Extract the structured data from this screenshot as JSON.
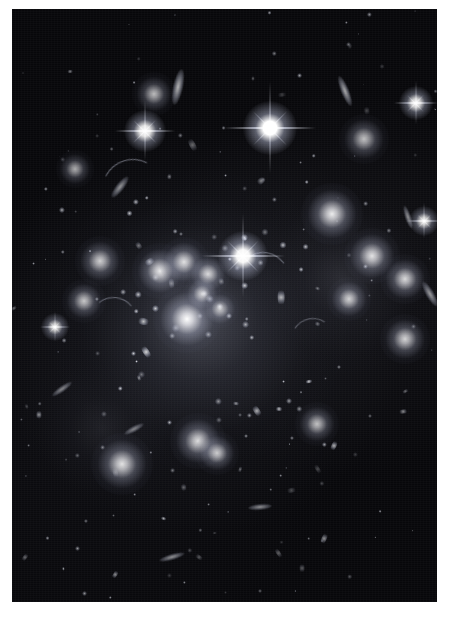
{
  "image": {
    "title": "Galaxy Cluster Deep Field",
    "subject": "galaxy-cluster",
    "observation_band": "optical",
    "border_color": "#ffffff",
    "sky_color": "#07070a",
    "object_color": "#ffffff",
    "plate": {
      "x": 12,
      "y": 9,
      "width": 425,
      "height": 593
    },
    "canvas": {
      "width": 451,
      "height": 621
    }
  },
  "chart_data": {
    "type": "scatter",
    "xlabel": "",
    "ylabel": "",
    "xlim": [
      0,
      425
    ],
    "ylim": [
      0,
      593
    ],
    "grid": false,
    "legend": null,
    "series": [
      {
        "name": "diffuse-intracluster-light",
        "values": [
          {
            "x": 186,
            "y": 310,
            "r": 150,
            "b": 0.2
          },
          {
            "x": 330,
            "y": 270,
            "r": 95,
            "b": 0.12
          },
          {
            "x": 90,
            "y": 420,
            "r": 80,
            "b": 0.08
          }
        ]
      },
      {
        "name": "bright-stars-with-diffraction-spikes",
        "values": [
          {
            "x": 258,
            "y": 119,
            "r": 6.5,
            "b": 1.0,
            "spike": 46
          },
          {
            "x": 231,
            "y": 247,
            "r": 6.0,
            "b": 0.96,
            "spike": 42
          },
          {
            "x": 133,
            "y": 122,
            "r": 5.0,
            "b": 0.88,
            "spike": 30
          },
          {
            "x": 404,
            "y": 94,
            "r": 4.0,
            "b": 0.8,
            "spike": 22
          },
          {
            "x": 412,
            "y": 212,
            "r": 3.6,
            "b": 0.74,
            "spike": 18
          },
          {
            "x": 43,
            "y": 318,
            "r": 3.4,
            "b": 0.7,
            "spike": 15
          }
        ]
      },
      {
        "name": "bright-elliptical-galaxies",
        "values": [
          {
            "x": 175,
            "y": 310,
            "r": 11,
            "b": 1.0
          },
          {
            "x": 148,
            "y": 262,
            "r": 9,
            "b": 0.9
          },
          {
            "x": 172,
            "y": 253,
            "r": 8,
            "b": 0.86
          },
          {
            "x": 196,
            "y": 265,
            "r": 7,
            "b": 0.82
          },
          {
            "x": 190,
            "y": 285,
            "r": 6,
            "b": 0.78
          },
          {
            "x": 320,
            "y": 205,
            "r": 10,
            "b": 0.92
          },
          {
            "x": 360,
            "y": 247,
            "r": 9,
            "b": 0.88
          },
          {
            "x": 393,
            "y": 270,
            "r": 8,
            "b": 0.84
          },
          {
            "x": 337,
            "y": 290,
            "r": 7,
            "b": 0.8
          },
          {
            "x": 393,
            "y": 330,
            "r": 8,
            "b": 0.82
          },
          {
            "x": 88,
            "y": 252,
            "r": 8,
            "b": 0.8
          },
          {
            "x": 72,
            "y": 292,
            "r": 7,
            "b": 0.76
          },
          {
            "x": 110,
            "y": 455,
            "r": 10,
            "b": 0.88
          },
          {
            "x": 186,
            "y": 432,
            "r": 9,
            "b": 0.86
          },
          {
            "x": 205,
            "y": 444,
            "r": 7,
            "b": 0.78
          },
          {
            "x": 208,
            "y": 300,
            "r": 6,
            "b": 0.72
          },
          {
            "x": 305,
            "y": 415,
            "r": 7,
            "b": 0.74
          },
          {
            "x": 142,
            "y": 85,
            "r": 7,
            "b": 0.72
          },
          {
            "x": 352,
            "y": 130,
            "r": 8,
            "b": 0.74
          },
          {
            "x": 63,
            "y": 160,
            "r": 6,
            "b": 0.66
          }
        ]
      },
      {
        "name": "edge-on-spiral-galaxies",
        "values": [
          {
            "x": 166,
            "y": 78,
            "rx": 5,
            "ry": 18,
            "angle": 12,
            "b": 0.7
          },
          {
            "x": 333,
            "y": 82,
            "rx": 4,
            "ry": 16,
            "angle": -22,
            "b": 0.66
          },
          {
            "x": 108,
            "y": 178,
            "rx": 4,
            "ry": 13,
            "angle": 38,
            "b": 0.58
          },
          {
            "x": 396,
            "y": 208,
            "rx": 3,
            "ry": 12,
            "angle": -18,
            "b": 0.56
          },
          {
            "x": 50,
            "y": 380,
            "rx": 3,
            "ry": 12,
            "angle": 55,
            "b": 0.52
          },
          {
            "x": 160,
            "y": 548,
            "rx": 3,
            "ry": 13,
            "angle": 74,
            "b": 0.56
          },
          {
            "x": 248,
            "y": 498,
            "rx": 3,
            "ry": 12,
            "angle": 85,
            "b": 0.54
          },
          {
            "x": 418,
            "y": 285,
            "rx": 4,
            "ry": 14,
            "angle": -30,
            "b": 0.6
          },
          {
            "x": 122,
            "y": 420,
            "rx": 3,
            "ry": 11,
            "angle": 62,
            "b": 0.5
          }
        ]
      },
      {
        "name": "gravitational-lensing-arcs",
        "values": [
          {
            "x": 120,
            "y": 180,
            "len": 60,
            "angle": -18,
            "b": 0.45
          },
          {
            "x": 250,
            "y": 268,
            "len": 50,
            "angle": 10,
            "b": 0.42
          },
          {
            "x": 100,
            "y": 310,
            "len": 45,
            "angle": 6,
            "b": 0.4
          },
          {
            "x": 300,
            "y": 330,
            "len": 42,
            "angle": -12,
            "b": 0.38
          }
        ]
      },
      {
        "name": "faint-field-galaxies-and-stars",
        "count": 420,
        "values": []
      }
    ]
  }
}
